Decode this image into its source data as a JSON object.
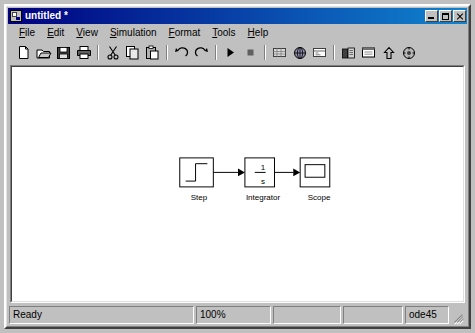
{
  "window": {
    "title": "untitled *",
    "icon": "simulink-model-icon",
    "buttons": {
      "minimize": "minimize-button",
      "maximize": "maximize-button",
      "close": "close-button"
    }
  },
  "menu": {
    "items": [
      {
        "label": "File",
        "accel": "F",
        "rest": "ile"
      },
      {
        "label": "Edit",
        "accel": "E",
        "rest": "dit"
      },
      {
        "label": "View",
        "accel": "V",
        "rest": "iew"
      },
      {
        "label": "Simulation",
        "accel": "S",
        "rest": "imulation"
      },
      {
        "label": "Format",
        "accel": "F",
        "rest": "ormat"
      },
      {
        "label": "Tools",
        "accel": "T",
        "rest": "ools"
      },
      {
        "label": "Help",
        "accel": "H",
        "rest": "elp"
      }
    ]
  },
  "toolbar": {
    "groups": [
      {
        "buttons": [
          {
            "name": "new-model-button",
            "icon": "new-document-icon",
            "tip": "New model"
          },
          {
            "name": "open-model-button",
            "icon": "open-folder-icon",
            "tip": "Open model"
          },
          {
            "name": "save-model-button",
            "icon": "floppy-disk-icon",
            "tip": "Save model"
          },
          {
            "name": "print-model-button",
            "icon": "printer-icon",
            "tip": "Print model"
          }
        ]
      },
      {
        "buttons": [
          {
            "name": "cut-button",
            "icon": "scissors-icon",
            "tip": "Cut"
          },
          {
            "name": "copy-button",
            "icon": "copy-pages-icon",
            "tip": "Copy"
          },
          {
            "name": "paste-button",
            "icon": "clipboard-paste-icon",
            "tip": "Paste"
          }
        ]
      },
      {
        "buttons": [
          {
            "name": "undo-button",
            "icon": "undo-arrow-icon",
            "tip": "Undo"
          },
          {
            "name": "redo-button",
            "icon": "redo-arrow-icon",
            "tip": "Redo"
          }
        ]
      },
      {
        "buttons": [
          {
            "name": "start-simulation-button",
            "icon": "play-triangle-icon",
            "tip": "Start simulation"
          },
          {
            "name": "stop-simulation-button",
            "icon": "stop-square-icon",
            "tip": "Stop simulation"
          }
        ]
      },
      {
        "buttons": [
          {
            "name": "update-diagram-button",
            "icon": "diagram-grid-icon",
            "tip": "Update diagram"
          },
          {
            "name": "simulation-parameters-button",
            "icon": "globe-clock-icon",
            "tip": "Simulation parameters"
          },
          {
            "name": "toggle-model-browser-button",
            "icon": "model-browser-icon",
            "tip": "Model browser"
          }
        ]
      },
      {
        "buttons": [
          {
            "name": "library-browser-button",
            "icon": "library-browser-icon",
            "tip": "Library browser"
          },
          {
            "name": "block-properties-button",
            "icon": "block-window-icon",
            "tip": "Block properties"
          },
          {
            "name": "go-to-parent-button",
            "icon": "up-arrow-icon",
            "tip": "Go to parent system"
          },
          {
            "name": "debug-button",
            "icon": "debugger-icon",
            "tip": "Debugger"
          }
        ]
      }
    ]
  },
  "diagram": {
    "blocks": [
      {
        "name": "step-block",
        "label": "Step",
        "type": "step",
        "x": 172,
        "y": 94,
        "w": 34,
        "h": 30
      },
      {
        "name": "integrator-block",
        "label": "Integrator",
        "numerator": "1",
        "denominator": "s",
        "type": "integrator",
        "x": 236,
        "y": 94,
        "w": 30,
        "h": 30
      },
      {
        "name": "scope-block",
        "label": "Scope",
        "type": "scope",
        "x": 292,
        "y": 94,
        "w": 30,
        "h": 30
      }
    ],
    "signals": [
      {
        "name": "signal-step-to-integrator",
        "from": "step-block",
        "to": "integrator-block"
      },
      {
        "name": "signal-integrator-to-scope",
        "from": "integrator-block",
        "to": "scope-block"
      }
    ]
  },
  "status_bar": {
    "message": "Ready",
    "zoom": "100%",
    "pane3": "",
    "pane4": "",
    "solver": "ode45"
  }
}
